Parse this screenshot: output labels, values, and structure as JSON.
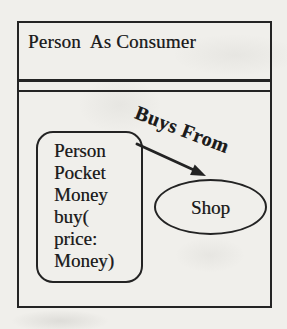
{
  "diagram": {
    "frame": {
      "title": "Person  As Consumer"
    },
    "class_box": {
      "lines": [
        "Person",
        "Pocket",
        "Money",
        "buy(",
        "price:",
        "Money)"
      ]
    },
    "association": {
      "label": "Buys From"
    },
    "shop": {
      "label": "Shop"
    },
    "colors": {
      "ink": "#242424",
      "paper": "#f0efeb",
      "text": "#1b1b1b"
    }
  }
}
